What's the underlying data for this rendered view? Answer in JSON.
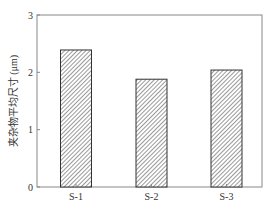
{
  "chart_data": {
    "type": "bar",
    "title": "",
    "xlabel": "",
    "ylabel": "夹杂物平均尺寸 (μm)",
    "categories": [
      "S-1",
      "S-2",
      "S-3"
    ],
    "values": [
      2.39,
      1.88,
      2.04
    ],
    "ylim": [
      0,
      3
    ],
    "yticks": [
      "0",
      "1",
      "2",
      "3"
    ],
    "grid": false,
    "legend": null,
    "bar_style": "diagonal-hatch",
    "colors": {
      "axis": "#888888",
      "bar_edge": "#333333",
      "hatch": "#555555"
    }
  }
}
